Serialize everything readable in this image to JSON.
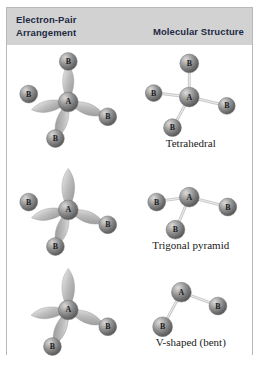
{
  "figure": {
    "header": {
      "left_line1": "Electron-Pair",
      "left_line2": "Arrangement",
      "right": "Molecular Structure"
    },
    "colors": {
      "header_band": "#d2d2d2",
      "panel_border": "#b9b9b9",
      "sphere_mid": "#8a8a8a",
      "sphere_light": "#d8d8d8",
      "sphere_dark": "#5c5c5c",
      "lobe_light": "#e2e2e2",
      "lobe_mid": "#a8a8a8",
      "bond": "#c9c9c9",
      "text": "#1d2a44"
    },
    "rows": [
      {
        "name": "tetrahedral",
        "caption": "Tetrahedral",
        "electron_pairs": 4,
        "bonding_pairs": 4,
        "lone_pairs": 0,
        "central_atom": "A",
        "terminal_atom": "B",
        "lobes": [
          {
            "angle": -90,
            "capped": true,
            "label": "B"
          },
          {
            "angle": 168,
            "capped": true,
            "label": "B"
          },
          {
            "angle": 20,
            "capped": true,
            "label": "B"
          },
          {
            "angle": 108,
            "capped": true,
            "label": "B"
          }
        ],
        "bonds": [
          {
            "angle": -90,
            "label": "B"
          },
          {
            "angle": 170,
            "label": "B"
          },
          {
            "angle": 12,
            "label": "B"
          },
          {
            "angle": 110,
            "label": "B"
          }
        ]
      },
      {
        "name": "trigonal-pyramid",
        "caption": "Trigonal pyramid",
        "electron_pairs": 4,
        "bonding_pairs": 3,
        "lone_pairs": 1,
        "central_atom": "A",
        "terminal_atom": "B",
        "lobes": [
          {
            "angle": -90,
            "capped": false,
            "label": ""
          },
          {
            "angle": 168,
            "capped": true,
            "label": "B"
          },
          {
            "angle": 20,
            "capped": true,
            "label": "B"
          },
          {
            "angle": 108,
            "capped": true,
            "label": "B"
          }
        ],
        "bonds": [
          {
            "angle": 172,
            "label": "B"
          },
          {
            "angle": 8,
            "label": "B"
          },
          {
            "angle": 108,
            "label": "B"
          }
        ]
      },
      {
        "name": "v-shaped-bent",
        "caption": "V-shaped (bent)",
        "electron_pairs": 4,
        "bonding_pairs": 2,
        "lone_pairs": 2,
        "central_atom": "A",
        "terminal_atom": "B",
        "lobes": [
          {
            "angle": -90,
            "capped": false,
            "label": ""
          },
          {
            "angle": 172,
            "capped": false,
            "label": ""
          },
          {
            "angle": 22,
            "capped": true,
            "label": "B"
          },
          {
            "angle": 112,
            "capped": true,
            "label": "B"
          }
        ],
        "bonds": [
          {
            "angle": 20,
            "label": "B"
          },
          {
            "angle": 115,
            "label": "B"
          }
        ]
      }
    ]
  }
}
